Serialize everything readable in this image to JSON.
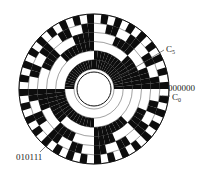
{
  "diagram": {
    "bits": 6,
    "sectors": 64,
    "center": [
      94,
      89
    ],
    "outer_radius": 75,
    "hole_radius": 17,
    "track_inner_radius": 20,
    "colors": {
      "dark": "#0d0d0d",
      "light": "#ffffff",
      "text": "#222222"
    },
    "tracks": [
      "C5",
      "C4",
      "C3",
      "C2",
      "C1",
      "C0"
    ]
  },
  "labels": {
    "c5": {
      "main": "C",
      "sub": "5"
    },
    "zero_code": "000000",
    "c0": {
      "main": "C",
      "sub": "0"
    },
    "sample_code": "010111"
  }
}
